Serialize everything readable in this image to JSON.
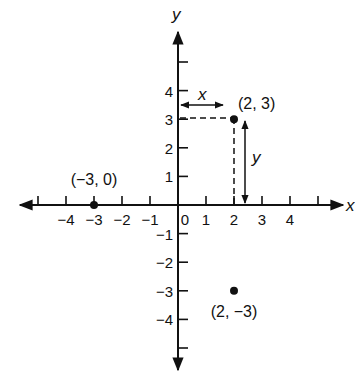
{
  "chart_data": {
    "type": "scatter",
    "title": "",
    "xlabel": "x",
    "ylabel": "y",
    "xlim": [
      -5.5,
      6
    ],
    "ylim": [
      -5.8,
      6
    ],
    "grid": false,
    "x_ticks": [
      -5,
      -4,
      -3,
      -2,
      -1,
      1,
      2,
      3,
      4,
      5
    ],
    "x_tick_labels": [
      {
        "value": -4,
        "label": "−4"
      },
      {
        "value": -3,
        "label": "−3"
      },
      {
        "value": -2,
        "label": "−2"
      },
      {
        "value": -1,
        "label": "−1"
      },
      {
        "value": 0,
        "label": "0"
      },
      {
        "value": 1,
        "label": "1"
      },
      {
        "value": 2,
        "label": "2"
      },
      {
        "value": 3,
        "label": "3"
      },
      {
        "value": 4,
        "label": "4"
      }
    ],
    "y_ticks": [
      5,
      4,
      3,
      2,
      1,
      -1,
      -2,
      -3,
      -4,
      -5
    ],
    "y_tick_labels": [
      {
        "value": 4,
        "label": "4"
      },
      {
        "value": 3,
        "label": "3"
      },
      {
        "value": 2,
        "label": "2"
      },
      {
        "value": 1,
        "label": "1"
      },
      {
        "value": -1,
        "label": "−1"
      },
      {
        "value": -2,
        "label": "−2"
      },
      {
        "value": -3,
        "label": "−3"
      },
      {
        "value": -4,
        "label": "−4"
      }
    ],
    "points": [
      {
        "x": 2,
        "y": 3,
        "label": "(2, 3)"
      },
      {
        "x": -3,
        "y": 0,
        "label": "(−3, 0)"
      },
      {
        "x": 2,
        "y": -3,
        "label": "(2, −3)"
      }
    ],
    "annotations": [
      {
        "type": "dashed-projection",
        "from": [
          2,
          3
        ],
        "to_x_axis": true,
        "to_y_axis": true
      },
      {
        "type": "double-arrow",
        "orientation": "horizontal",
        "from": [
          0,
          3.45
        ],
        "to": [
          2,
          3.45
        ],
        "label": "x"
      },
      {
        "type": "double-arrow",
        "orientation": "vertical",
        "from": [
          2.4,
          3
        ],
        "to": [
          2.4,
          0
        ],
        "label": "y"
      }
    ]
  },
  "labels": {
    "x_axis": "x",
    "y_axis": "y",
    "measure_x": "x",
    "measure_y": "y"
  }
}
